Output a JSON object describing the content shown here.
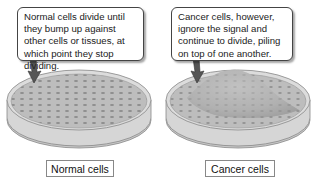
{
  "panels": [
    {
      "id": "normal",
      "callout": "Normal cells divide until they bump up against other cells or tissues, at which point they stop dividing.",
      "label": "Normal cells",
      "dish_style": "flat-monolayer"
    },
    {
      "id": "cancer",
      "callout": "Cancer cells, however, ignore the signal and continue to divide, piling on top of one another.",
      "label": "Cancer cells",
      "dish_style": "piled-mound"
    }
  ],
  "colors": {
    "dish_fill": "#b8b8b8",
    "dish_rim": "#d8d8d8",
    "cell_dots": "#8c8c8c",
    "arrow": "#555555",
    "border": "#444444"
  }
}
